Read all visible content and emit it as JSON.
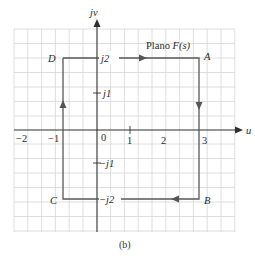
{
  "figure": {
    "caption": "(b)",
    "plane_label_prefix": "Plano ",
    "plane_label_func": "F(s)",
    "axes": {
      "horizontal_label": "u",
      "vertical_label": "jv"
    },
    "x_ticks": [
      {
        "label": "−2",
        "value": -2
      },
      {
        "label": "−1",
        "value": -1
      },
      {
        "label": "0",
        "value": 0
      },
      {
        "label": "1",
        "value": 1
      },
      {
        "label": "2",
        "value": 2
      },
      {
        "label": "3",
        "value": 3
      }
    ],
    "y_ticks": [
      {
        "label": "j2",
        "value": 2
      },
      {
        "label": "j1",
        "value": 1
      },
      {
        "label": "−j1",
        "value": -1
      },
      {
        "label": "−j2",
        "value": -2
      }
    ],
    "contour_points": [
      {
        "name": "A",
        "u": 3,
        "v": 2
      },
      {
        "name": "B",
        "u": 3,
        "v": -2
      },
      {
        "name": "C",
        "u": -1,
        "v": -2
      },
      {
        "name": "D",
        "u": -1,
        "v": 2
      }
    ],
    "direction": "clockwise: D → A → B → C → D",
    "colors": {
      "grid": "#d4d4d4",
      "axes": "#333333",
      "contour": "#555555"
    }
  }
}
